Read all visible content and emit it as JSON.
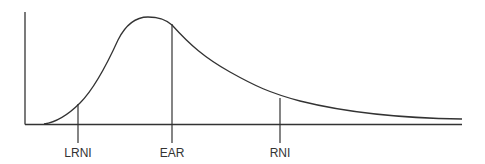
{
  "diagram": {
    "type": "distribution-curve",
    "colors": {
      "line": "#333333",
      "background": "#ffffff"
    },
    "markers": [
      {
        "id": "lrni",
        "label": "LRNI"
      },
      {
        "id": "ear",
        "label": "EAR"
      },
      {
        "id": "rni",
        "label": "RNI"
      }
    ]
  }
}
